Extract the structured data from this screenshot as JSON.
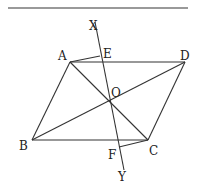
{
  "figure": {
    "type": "geometry",
    "points": {
      "A": {
        "label": "A",
        "x": 70,
        "y": 62,
        "lx": 58,
        "ly": 60
      },
      "B": {
        "label": "B",
        "x": 32,
        "y": 140,
        "lx": 19,
        "ly": 150
      },
      "C": {
        "label": "C",
        "x": 148,
        "y": 140,
        "lx": 149,
        "ly": 155
      },
      "D": {
        "label": "D",
        "x": 185,
        "y": 62,
        "lx": 180,
        "ly": 60
      },
      "O": {
        "label": "O",
        "x": 109,
        "y": 102,
        "lx": 111,
        "ly": 97
      },
      "E": {
        "label": "E",
        "x": 100,
        "y": 56,
        "lx": 103,
        "ly": 58
      },
      "F": {
        "label": "F",
        "x": 119,
        "y": 147,
        "lx": 108,
        "ly": 159
      },
      "X": {
        "label": "X",
        "x": 95,
        "y": 22,
        "lx": 89,
        "ly": 30
      },
      "Y": {
        "label": "Y",
        "x": 124,
        "y": 170,
        "lx": 118,
        "ly": 181
      }
    },
    "segments": [
      [
        "A",
        "D"
      ],
      [
        "D",
        "C"
      ],
      [
        "C",
        "B"
      ],
      [
        "B",
        "A"
      ],
      [
        "A",
        "C"
      ],
      [
        "B",
        "D"
      ],
      [
        "X",
        "Y"
      ],
      [
        "A",
        "E"
      ],
      [
        "C",
        "F"
      ]
    ],
    "top_rule": {
      "x1": 8,
      "y1": 8,
      "x2": 188,
      "y2": 8
    }
  }
}
